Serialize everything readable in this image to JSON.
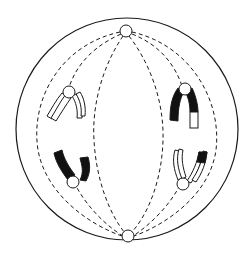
{
  "diagram": {
    "title": "",
    "type": "cell-division-spindle",
    "colors": {
      "background": "#ffffff",
      "stroke": "#1a1a1a",
      "dark_chromatid": "#111111",
      "light_chromatid": "#ffffff"
    },
    "cell": {
      "cx": 127,
      "cy": 129,
      "r": 111
    },
    "poles": [
      {
        "name": "top-centrosome",
        "cx": 126,
        "cy": 31,
        "r": 6
      },
      {
        "name": "bottom-centrosome",
        "cx": 128,
        "cy": 236,
        "r": 6
      }
    ],
    "chromosomes": [
      {
        "name": "upper-left-chromosome",
        "fill": "white",
        "position": "upper-left"
      },
      {
        "name": "upper-right-chromosome",
        "fill": "black-with-white-segment",
        "position": "upper-right"
      },
      {
        "name": "lower-left-chromosome",
        "fill": "black",
        "position": "lower-left"
      },
      {
        "name": "lower-right-chromosome",
        "fill": "white-with-black-segment",
        "position": "lower-right"
      }
    ],
    "labels": []
  }
}
